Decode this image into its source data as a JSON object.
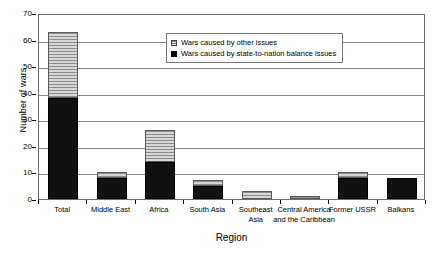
{
  "chart_data": {
    "type": "bar",
    "subtype": "stacked-bar",
    "title": "",
    "xlabel": "Region",
    "ylabel": "Number of wars",
    "ylim": [
      0,
      70
    ],
    "ytick_step": 10,
    "yticks": [
      0,
      10,
      20,
      30,
      40,
      50,
      60,
      70
    ],
    "grid": true,
    "legend_position": "inside-top-center",
    "categories": [
      "Total",
      "Middle East",
      "Africa",
      "South Asia",
      "Southeast Asia",
      "Central America and the Caribbean",
      "Former USSR",
      "Balkans"
    ],
    "category_labels_wrapped": [
      [
        "Total"
      ],
      [
        "Middle East"
      ],
      [
        "Africa"
      ],
      [
        "South Asia"
      ],
      [
        "Southeast",
        "Asia"
      ],
      [
        "Central America",
        "and the Caribbean"
      ],
      [
        "Former USSR"
      ],
      [
        "Balkans"
      ]
    ],
    "series": [
      {
        "name": "Wars caused by state-to-nation balance issues",
        "fill": "solid-black",
        "color": "#111111",
        "values": [
          38,
          8,
          14,
          5,
          0,
          0,
          8,
          8
        ]
      },
      {
        "name": "Wars caused by other issues",
        "fill": "horizontal-hatch-gray",
        "color": "#b9b9b9",
        "values": [
          25,
          2,
          12,
          2,
          3,
          1,
          2,
          0
        ]
      }
    ],
    "totals": [
      63,
      10,
      26,
      7,
      3,
      1,
      10,
      8
    ]
  },
  "legend": {
    "items": [
      {
        "label": "Wars caused by other issues",
        "swatch": "hatch"
      },
      {
        "label": "Wars caused by state-to-nation balance issues",
        "swatch": "solid"
      }
    ]
  },
  "axes": {
    "y_title": "Number of wars",
    "x_title": "Region",
    "y_tick_labels": [
      "70",
      "60",
      "50",
      "40",
      "30",
      "20",
      "10",
      "0"
    ]
  }
}
